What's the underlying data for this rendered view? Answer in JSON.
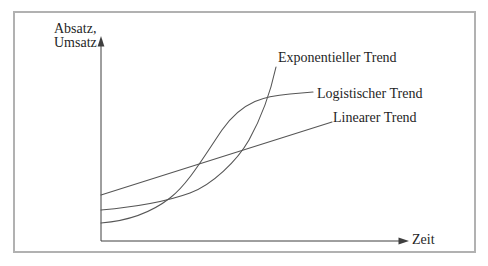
{
  "figure": {
    "type": "qualitative trend line diagram",
    "y_axis": {
      "line1": "Absatz,",
      "line2": "Umsatz"
    },
    "x_axis": {
      "label": "Zeit"
    },
    "curves": [
      {
        "name": "exponential-trend",
        "label": "Exponentieller Trend",
        "shape": "slow start, accelerating rise, steepest at right end, ends highest",
        "path": "M 101,210 C 135,207 168,201 190,193 C 212,185 237,161 249,140 C 259,122 269,99 276,67"
      },
      {
        "name": "logistic-trend",
        "label": "Logistischer Trend",
        "shape": "S-curve: lowest start, steepest in middle, saturates flat at right",
        "path": "M 101,223 C 127,221 152,212 170,198 C 188,184 203,158 222,130 C 243,100 266,96 290,94 L 313,92"
      },
      {
        "name": "linear-trend",
        "label": "Linearer Trend",
        "shape": "straight rising line, highest start, lowest end",
        "path": "M 101,195 L 332,122"
      }
    ],
    "axes_paths": {
      "y_axis_line": "M 101,44 L 101,241",
      "x_axis_line": "M 101,241 L 401,241",
      "y_arrow_points": "101,36 97.6,46.5 104.4,46.5",
      "x_arrow_points": "409,241 398.5,237.6 398.5,244.4"
    },
    "colors": {
      "line": "#565656",
      "axis": "#3f3f3f",
      "text": "#1f1f1f",
      "frame_border": "#b1b1b1",
      "background": "#ffffff"
    }
  }
}
